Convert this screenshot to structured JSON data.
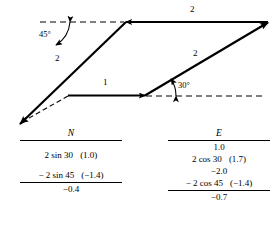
{
  "figure": {
    "type": "vector-addition-diagram"
  },
  "diagram": {
    "vectors": [
      {
        "name": "vector-1-east",
        "label": "1",
        "magnitude": 1,
        "direction_deg": 0,
        "label_x": 103,
        "label_y": 80
      },
      {
        "name": "vector-2-at-30",
        "label": "2",
        "magnitude": 2,
        "direction_deg": 30,
        "label_x": 194,
        "label_y": 51
      },
      {
        "name": "vector-2-west",
        "label": "2",
        "magnitude": 2,
        "direction_deg": 180,
        "label_x": 190,
        "label_y": 7
      },
      {
        "name": "vector-2-at-45-sw",
        "label": "2",
        "magnitude": 2,
        "direction_deg": 225,
        "label_x": 57,
        "label_y": 56
      }
    ],
    "angles": [
      {
        "name": "angle-45",
        "label": "45°",
        "x": 40,
        "y": 29
      },
      {
        "name": "angle-30",
        "label": "30°",
        "x": 178,
        "y": 84
      }
    ]
  },
  "table": {
    "columns": [
      {
        "name": "north-column",
        "header": "N",
        "rows": [
          {
            "expr": "",
            "paren": ""
          },
          {
            "expr": "2 sin 30",
            "paren": "(1.0)"
          },
          {
            "expr": "",
            "paren": ""
          },
          {
            "expr": "− 2 sin 45",
            "paren": "(−1.4)"
          }
        ],
        "sum": "−0.4"
      },
      {
        "name": "east-column",
        "header": "E",
        "rows": [
          {
            "expr": "1.0",
            "paren": ""
          },
          {
            "expr": "2 cos 30",
            "paren": "(1.7)"
          },
          {
            "expr": "−2.0",
            "paren": ""
          },
          {
            "expr": "− 2 cos 45",
            "paren": "(−1.4)"
          }
        ],
        "sum": "−0.7"
      }
    ]
  },
  "colors": {
    "ink": "#000000",
    "background": "#ffffff"
  }
}
